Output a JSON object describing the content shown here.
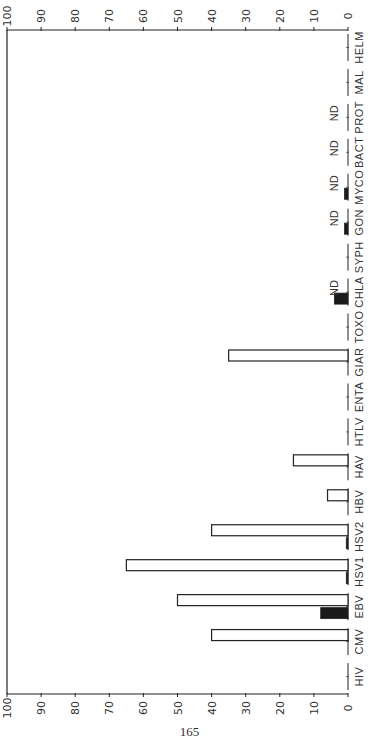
{
  "page": {
    "page_number": "165"
  },
  "colors": {
    "ink": "#222222",
    "fill_open": "#ffffff",
    "fill_solid": "#1a1a1a"
  },
  "chart_data": {
    "type": "bar",
    "orientation": "rotated 90° (horizontal bars in image, value axis along top/bottom)",
    "title": "",
    "xlabel": "",
    "ylabel": "",
    "ylim": [
      0,
      100
    ],
    "yticks": [
      0,
      10,
      20,
      30,
      40,
      50,
      60,
      70,
      80,
      90,
      100
    ],
    "grid": false,
    "legend": null,
    "categories": [
      "HIV",
      "CMV",
      "EBV",
      "HSV1",
      "HSV2",
      "HBV",
      "HAV",
      "HTLV",
      "ENTA",
      "GIAR",
      "TOXO",
      "CHLA",
      "SYPH",
      "GON",
      "MYCO",
      "BACT",
      "PROT",
      "MAL",
      "HELM"
    ],
    "series": [
      {
        "name": "open bars",
        "style": "outline",
        "values": [
          0,
          40,
          50,
          65,
          40,
          6,
          16,
          0,
          0,
          35,
          0,
          null,
          0,
          null,
          null,
          null,
          null,
          0,
          0
        ]
      },
      {
        "name": "solid bars",
        "style": "filled",
        "values": [
          0,
          0,
          8,
          0.5,
          0.5,
          0,
          0,
          0,
          0,
          0,
          0,
          4,
          0,
          1,
          1,
          null,
          null,
          0,
          0
        ]
      }
    ],
    "annotations": [
      {
        "category": "CHLA",
        "text": "ND"
      },
      {
        "category": "GON",
        "text": "ND"
      },
      {
        "category": "MYCO",
        "text": "ND"
      },
      {
        "category": "BACT",
        "text": "ND"
      },
      {
        "category": "PROT",
        "text": "ND"
      }
    ]
  }
}
